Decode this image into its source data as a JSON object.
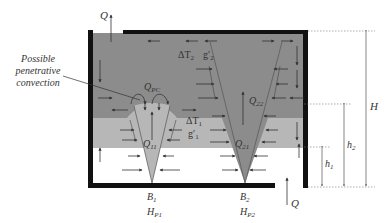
{
  "figure": {
    "type": "schematic",
    "colors": {
      "upper_layer": "#8c8c8c",
      "lower_layer": "#b7b7b7",
      "ambient": "#ffffff",
      "walls": "#111111",
      "arrows": "#333333",
      "dimension_lines": "#666666"
    }
  },
  "labels": {
    "q_top": "Q",
    "q_bottom": "Q",
    "annotation": [
      "Possible",
      "penetrative",
      "convection"
    ],
    "q_pc": "Q",
    "q_pc_sub": "PC",
    "delta_t2": "ΔT",
    "delta_t2_sub": "2",
    "g2": "g′",
    "g2_sub": "2",
    "delta_t1": "ΔT",
    "delta_t1_sub": "1",
    "g1": "g′",
    "g1_sub": "1",
    "q11": "Q",
    "q11_sub": "11",
    "q21": "Q",
    "q21_sub": "21",
    "q22": "Q",
    "q22_sub": "22",
    "b1": "B",
    "b1_sub": "1",
    "b2": "B",
    "b2_sub": "2",
    "hp1": "H",
    "hp1_sub": "P1",
    "hp2": "H",
    "hp2_sub": "P2",
    "dim_H": "H",
    "dim_h2": "h",
    "dim_h2_sub": "2",
    "dim_h1": "h",
    "dim_h1_sub": "1"
  }
}
